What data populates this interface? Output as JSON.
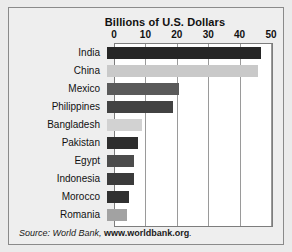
{
  "chart_data": {
    "type": "bar",
    "orientation": "horizontal",
    "title": "Billions of U.S. Dollars",
    "xlabel": "",
    "ylabel": "",
    "xlim": [
      0,
      50
    ],
    "xticks": [
      0,
      10,
      20,
      30,
      40,
      50
    ],
    "xtick_labels": [
      "0",
      "10",
      "20",
      "30",
      "40",
      "50"
    ],
    "grid": true,
    "grid_axis": "x",
    "legend": false,
    "categories": [
      "India",
      "China",
      "Mexico",
      "Philippines",
      "Bangladesh",
      "Pakistan",
      "Egypt",
      "Indonesia",
      "Morocco",
      "Romania"
    ],
    "values": [
      49,
      48,
      23,
      21,
      11,
      10,
      8.5,
      8.5,
      7,
      6.5
    ],
    "bar_colors": [
      "#262626",
      "#c9c9c9",
      "#5a5a5a",
      "#424242",
      "#d2d2d2",
      "#2e2e2e",
      "#4c4c4c",
      "#3b3b3b",
      "#303030",
      "#a2a2a2"
    ],
    "annotations": []
  },
  "footer": {
    "source_prefix": "Source: World Bank,",
    "source_url": "www.worldbank.org",
    "source_suffix": "."
  }
}
